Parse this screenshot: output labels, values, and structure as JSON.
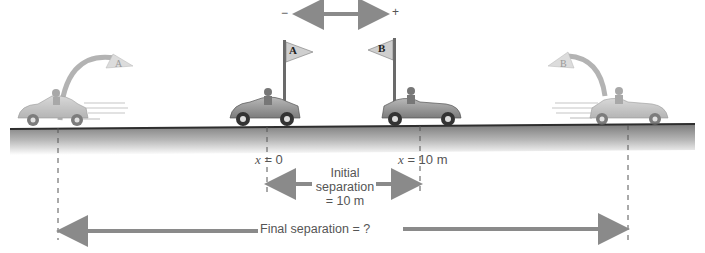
{
  "direction_axis": {
    "minus": "−",
    "plus": "+"
  },
  "cars": [
    {
      "id": "A",
      "flag_label": "A",
      "state": "initial",
      "position_label_var": "x",
      "position_label_value": "= 0"
    },
    {
      "id": "B",
      "flag_label": "B",
      "state": "initial",
      "position_label_var": "x",
      "position_label_value": "= 10 m"
    },
    {
      "id": "A",
      "flag_label": "A",
      "state": "final"
    },
    {
      "id": "B",
      "flag_label": "B",
      "state": "final"
    }
  ],
  "initial_separation": {
    "line1": "Initial",
    "line2": "separation",
    "line3": "= 10 m"
  },
  "final_separation": {
    "label": "Final separation = ?"
  },
  "colors": {
    "arrow": "#8a8a8a",
    "car_body": "#9a9a9a",
    "ground_top": "#3a3a3a",
    "text": "#555555"
  }
}
